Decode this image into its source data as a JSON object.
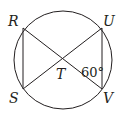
{
  "diagram": {
    "type": "circle-with-inscribed-chords",
    "circle": {
      "cx": 63,
      "cy": 60,
      "r": 49
    },
    "points": [
      {
        "name": "R",
        "x": 23,
        "y": 28,
        "label_x": 8,
        "label_y": 26
      },
      {
        "name": "U",
        "x": 102,
        "y": 28,
        "label_x": 103,
        "label_y": 26
      },
      {
        "name": "S",
        "x": 23,
        "y": 89,
        "label_x": 9,
        "label_y": 103
      },
      {
        "name": "V",
        "x": 102,
        "y": 89,
        "label_x": 103,
        "label_y": 103
      },
      {
        "name": "T",
        "x": 62,
        "y": 59,
        "label_x": 56,
        "label_y": 79
      }
    ],
    "segments": [
      "RV",
      "SU",
      "RS",
      "UV"
    ],
    "angle_label": {
      "text": "60°",
      "x": 81,
      "y": 77,
      "at": "T",
      "between": [
        "TV",
        "TU"
      ]
    },
    "stroke_color": "#231f20"
  }
}
